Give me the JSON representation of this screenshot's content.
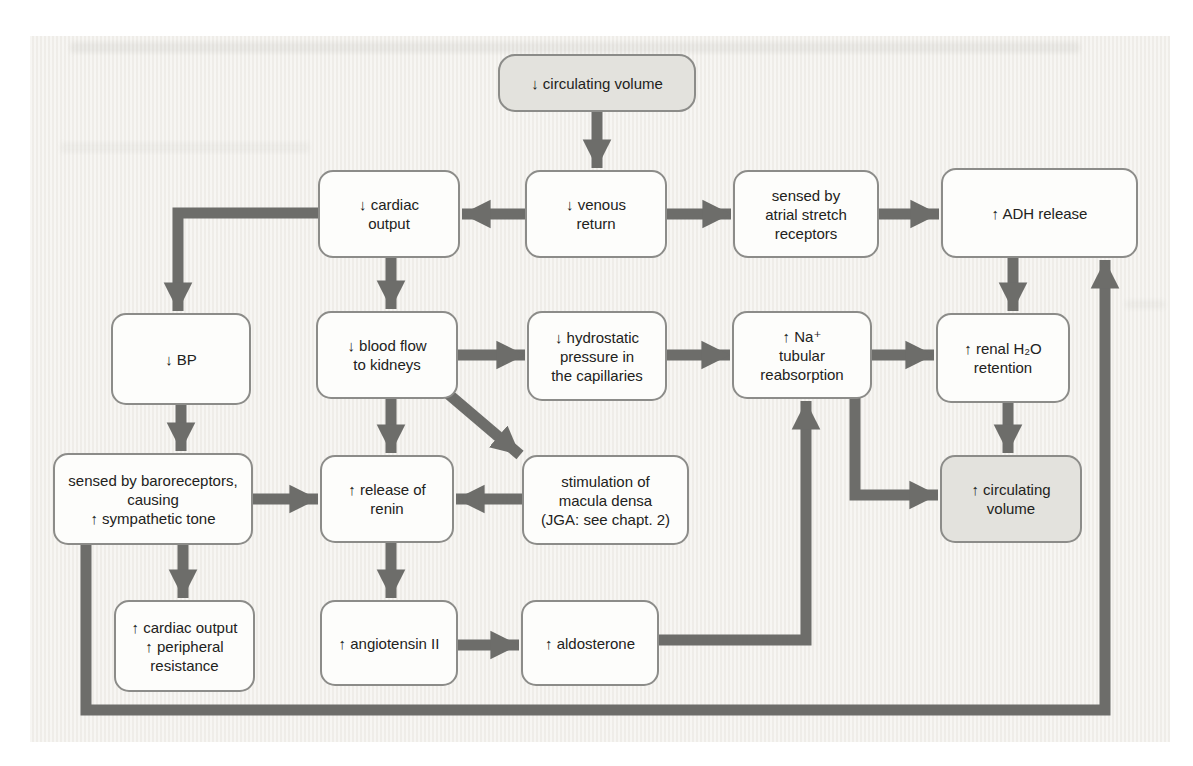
{
  "diagram": {
    "colors": {
      "page_background": "#f3f1ed",
      "node_fill": "#fdfdfb",
      "node_border": "#8c8c89",
      "highlight_node_fill": "#e3e2dd",
      "arrow": "#6d6d6a",
      "text": "#222220"
    },
    "nodes": {
      "circulating_volume_down": {
        "label": "↓ circulating volume",
        "highlighted": true
      },
      "cardiac_output": {
        "label": "↓ cardiac\noutput",
        "highlighted": false
      },
      "venous_return": {
        "label": "↓ venous\nreturn",
        "highlighted": false
      },
      "atrial_stretch": {
        "label": "sensed by\natrial stretch\nreceptors",
        "highlighted": false
      },
      "adh_release": {
        "label": "↑ ADH release",
        "highlighted": false
      },
      "bp": {
        "label": "↓ BP",
        "highlighted": false
      },
      "blood_flow_kidneys": {
        "label": "↓ blood flow\nto kidneys",
        "highlighted": false
      },
      "hydrostatic_pressure": {
        "label": "↓ hydrostatic\npressure in\nthe capillaries",
        "highlighted": false
      },
      "na_tubular_reabsorption": {
        "label": "↑ Na⁺\ntubular\nreabsorption",
        "highlighted": false
      },
      "renal_h2o_retention": {
        "label": "↑ renal H₂O\nretention",
        "highlighted": false
      },
      "baroreceptors": {
        "label": "sensed by baroreceptors,\ncausing\n↑ sympathetic tone",
        "highlighted": false
      },
      "renin_release": {
        "label": "↑ release of\nrenin",
        "highlighted": false
      },
      "macula_densa": {
        "label": "stimulation of\nmacula densa\n(JGA: see chapt. 2)",
        "highlighted": false
      },
      "circulating_volume_up": {
        "label": "↑ circulating\nvolume",
        "highlighted": true
      },
      "cardiac_output_peripheral": {
        "label": "↑ cardiac output\n↑ peripheral\nresistance",
        "highlighted": false
      },
      "angiotensin_ii": {
        "label": "↑ angiotensin II",
        "highlighted": false
      },
      "aldosterone": {
        "label": "↑ aldosterone",
        "highlighted": false
      }
    },
    "edges": [
      {
        "from": "circulating_volume_down",
        "to": "venous_return"
      },
      {
        "from": "venous_return",
        "to": "cardiac_output"
      },
      {
        "from": "venous_return",
        "to": "atrial_stretch"
      },
      {
        "from": "atrial_stretch",
        "to": "adh_release"
      },
      {
        "from": "cardiac_output",
        "to": "bp"
      },
      {
        "from": "cardiac_output",
        "to": "blood_flow_kidneys"
      },
      {
        "from": "bp",
        "to": "baroreceptors"
      },
      {
        "from": "blood_flow_kidneys",
        "to": "hydrostatic_pressure"
      },
      {
        "from": "blood_flow_kidneys",
        "to": "renin_release"
      },
      {
        "from": "blood_flow_kidneys",
        "to": "macula_densa"
      },
      {
        "from": "hydrostatic_pressure",
        "to": "na_tubular_reabsorption"
      },
      {
        "from": "na_tubular_reabsorption",
        "to": "renal_h2o_retention"
      },
      {
        "from": "adh_release",
        "to": "renal_h2o_retention"
      },
      {
        "from": "renal_h2o_retention",
        "to": "circulating_volume_up"
      },
      {
        "from": "baroreceptors",
        "to": "renin_release"
      },
      {
        "from": "macula_densa",
        "to": "renin_release"
      },
      {
        "from": "baroreceptors",
        "to": "cardiac_output_peripheral"
      },
      {
        "from": "renin_release",
        "to": "angiotensin_ii"
      },
      {
        "from": "angiotensin_ii",
        "to": "aldosterone"
      },
      {
        "from": "aldosterone",
        "to": "na_tubular_reabsorption"
      },
      {
        "from": "na_tubular_reabsorption",
        "to": "circulating_volume_up"
      },
      {
        "from": "baroreceptors",
        "to": "adh_release"
      }
    ]
  }
}
